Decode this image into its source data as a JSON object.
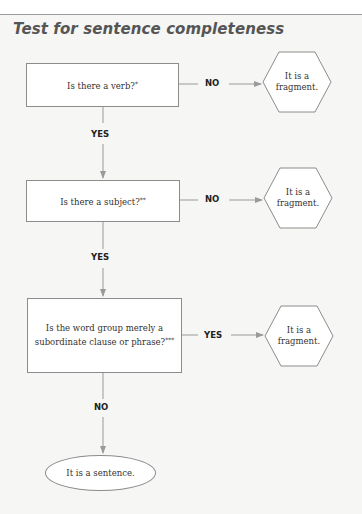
{
  "title": "Test for sentence completeness",
  "colors": {
    "background": "#f6f6f4",
    "box_fill": "#ffffff",
    "stroke": "#8c8c8c",
    "connector": "#9a9a9a",
    "title": "#555555",
    "label": "#222222"
  },
  "steps": [
    {
      "question": "Is there a verb?",
      "footnote_mark": "*",
      "branch_right_label": "NO",
      "result": {
        "line1": "It is a",
        "line2": "fragment."
      },
      "branch_down_label": "YES"
    },
    {
      "question": "Is there a subject?",
      "footnote_mark": "**",
      "branch_right_label": "NO",
      "result": {
        "line1": "It is a",
        "line2": "fragment."
      },
      "branch_down_label": "YES"
    },
    {
      "question_line1": "Is the word group merely a",
      "question_line2": "subordinate clause or phrase?",
      "footnote_mark": "***",
      "branch_right_label": "YES",
      "result": {
        "line1": "It is a",
        "line2": "fragment."
      },
      "branch_down_label": "NO"
    }
  ],
  "final": "It is a sentence."
}
